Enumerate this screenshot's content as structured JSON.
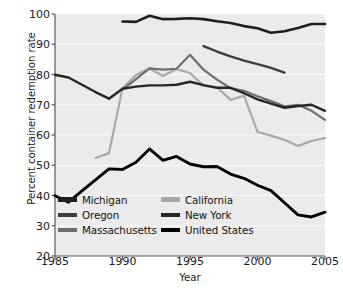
{
  "chart_data": {
    "type": "line",
    "title": "",
    "xlabel": "Year",
    "ylabel": "Percent container redemption rate",
    "xlim": [
      1985,
      2005
    ],
    "ylim": [
      20,
      100
    ],
    "xticks": [
      1985,
      1990,
      1995,
      2000,
      2005
    ],
    "yticks": [
      20,
      30,
      40,
      50,
      60,
      70,
      80,
      90,
      100
    ],
    "grid": "horizontal",
    "legend_position": "lower-left-inside",
    "plot_background": "#ebebeb",
    "series": [
      {
        "name": "Michigan",
        "color": "#1f1f1f",
        "x": [
          1990,
          1991,
          1992,
          1993,
          1994,
          1995,
          1996,
          1997,
          1998,
          1999,
          2000,
          2001,
          2002,
          2003,
          2004,
          2005
        ],
        "values": [
          97.5,
          97.4,
          99.4,
          98.3,
          98.4,
          98.6,
          98.3,
          97.6,
          97.0,
          96.0,
          95.3,
          93.8,
          94.3,
          95.4,
          96.7,
          96.7
        ]
      },
      {
        "name": "Oregon",
        "color": "#3d3d3d",
        "x": [
          1996,
          1997,
          1998,
          1999,
          2000,
          2001,
          2002
        ],
        "values": [
          89.4,
          87.6,
          86.0,
          84.6,
          83.4,
          82.2,
          80.6
        ]
      },
      {
        "name": "Massachusetts",
        "color": "#6e6e6e",
        "x": [
          1990,
          1991,
          1992,
          1993,
          1994,
          1995,
          1996,
          1997,
          1998,
          1999,
          2000,
          2001,
          2002,
          2003,
          2004,
          2005
        ],
        "values": [
          75.0,
          78.5,
          82.0,
          81.6,
          81.9,
          86.5,
          81.6,
          78.3,
          75.5,
          74.6,
          72.8,
          71.2,
          69.5,
          70.0,
          68.0,
          65.0
        ]
      },
      {
        "name": "California",
        "color": "#a8a8a8",
        "x": [
          1988,
          1989,
          1990,
          1991,
          1992,
          1993,
          1994,
          1995,
          1996,
          1997,
          1998,
          1999,
          2000,
          2001,
          2002,
          2003,
          2004,
          2005
        ],
        "values": [
          52.4,
          54.0,
          75.5,
          79.8,
          82.0,
          79.5,
          81.8,
          80.5,
          76.3,
          75.8,
          71.6,
          73.0,
          61.0,
          59.8,
          58.4,
          56.4,
          58.0,
          59.0
        ]
      },
      {
        "name": "New York",
        "color": "#262626",
        "x": [
          1985,
          1986,
          1987,
          1988,
          1989,
          1990,
          1991,
          1992,
          1993,
          1994,
          1995,
          1996,
          1997,
          1998,
          1999,
          2000,
          2001,
          2002,
          2003,
          2004,
          2005
        ],
        "values": [
          79.9,
          79.0,
          76.6,
          74.2,
          72.0,
          75.3,
          76.0,
          76.4,
          76.4,
          76.6,
          77.6,
          76.5,
          75.6,
          75.6,
          73.8,
          71.8,
          70.4,
          69.0,
          69.6,
          70.0,
          68.0
        ]
      },
      {
        "name": "United States",
        "color": "#000000",
        "x": [
          1985,
          1986,
          1987,
          1988,
          1989,
          1990,
          1991,
          1992,
          1993,
          1994,
          1995,
          1996,
          1997,
          1998,
          1999,
          2000,
          2001,
          2002,
          2003,
          2004,
          2005
        ],
        "values": [
          39.9,
          37.8,
          41.5,
          45.2,
          48.8,
          48.6,
          51.0,
          55.4,
          51.6,
          52.9,
          50.4,
          49.5,
          49.6,
          47.1,
          45.7,
          43.4,
          41.6,
          37.6,
          33.6,
          32.9,
          34.5
        ]
      }
    ]
  },
  "axes": {
    "ylabel": "Percent container redemption rate",
    "xlabel": "Year",
    "ytick_labels": [
      "100",
      "90",
      "80",
      "70",
      "60",
      "50",
      "40",
      "30",
      "20"
    ],
    "xtick_labels": [
      "1985",
      "1990",
      "1995",
      "2000",
      "2005"
    ]
  },
  "legend": {
    "entries": [
      {
        "label": "Michigan",
        "color": "#1f1f1f"
      },
      {
        "label": "California",
        "color": "#a8a8a8"
      },
      {
        "label": "Oregon",
        "color": "#3d3d3d"
      },
      {
        "label": "New York",
        "color": "#262626"
      },
      {
        "label": "Massachusetts",
        "color": "#6e6e6e"
      },
      {
        "label": "United States",
        "color": "#000000"
      }
    ]
  }
}
